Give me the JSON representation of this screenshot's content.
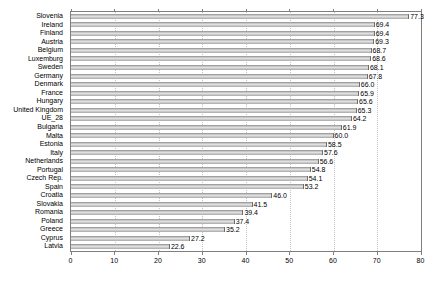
{
  "chart": {
    "background_color": "#ffffff",
    "axis_color": "#7f7f7f",
    "gridline_color": "#c3c3c3",
    "text_color": "#000000",
    "bar_color": "#c9c9c9"
  },
  "chart_data": {
    "type": "bar",
    "orientation": "horizontal",
    "title": "",
    "xlabel": "",
    "ylabel": "",
    "xlim": [
      0,
      80
    ],
    "xticks": [
      0,
      10,
      20,
      30,
      40,
      50,
      60,
      70,
      80
    ],
    "grid": "vertical dotted gridlines at each x tick",
    "legend": "none",
    "value_label_format": "one decimal at end of bar",
    "categories": [
      "Slovenia",
      "Ireland",
      "Finland",
      "Austria",
      "Belgium",
      "Luxemburg",
      "Sweden",
      "Germany",
      "Denmark",
      "France",
      "Hungary",
      "United Kingdom",
      "UE_28",
      "Bulgaria",
      "Malta",
      "Estonia",
      "Italy",
      "Netherlands",
      "Portugal",
      "Czech Rep.",
      "Spain",
      "Croatia",
      "Slovakia",
      "Romania",
      "Poland",
      "Greece",
      "Cyprus",
      "Latvia"
    ],
    "values": [
      77.3,
      69.4,
      69.4,
      69.3,
      68.7,
      68.6,
      68.1,
      67.8,
      66.0,
      65.9,
      65.6,
      65.3,
      64.2,
      61.9,
      60.0,
      58.5,
      57.6,
      56.6,
      54.8,
      54.1,
      53.2,
      46.0,
      41.5,
      39.4,
      37.4,
      35.2,
      27.2,
      22.6
    ]
  }
}
